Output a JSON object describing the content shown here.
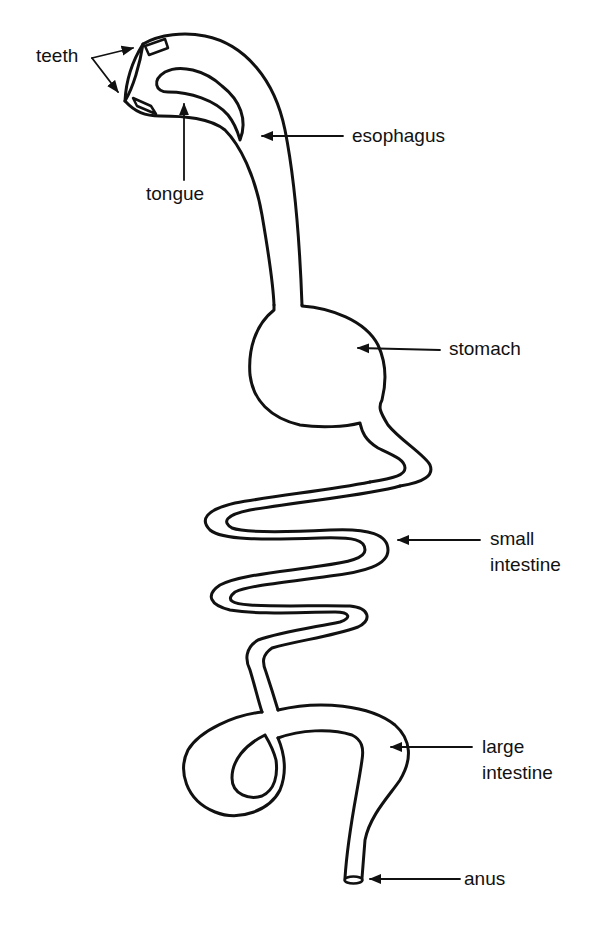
{
  "diagram": {
    "type": "anatomical-labeled-diagram",
    "stroke_color": "#111111",
    "background": "#ffffff",
    "labels": {
      "teeth": "teeth",
      "tongue": "tongue",
      "esophagus": "esophagus",
      "stomach": "stomach",
      "small_intestine_line1": "small",
      "small_intestine_line2": "intestine",
      "large_intestine_line1": "large",
      "large_intestine_line2": "intestine",
      "anus": "anus"
    }
  }
}
